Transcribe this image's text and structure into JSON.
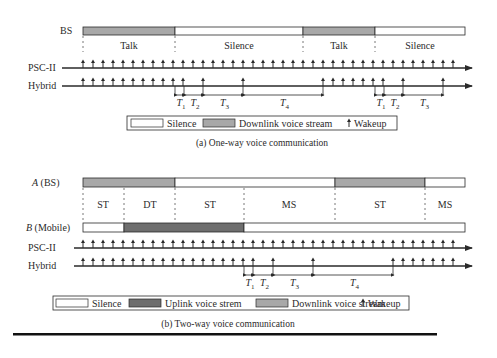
{
  "colors": {
    "downlink": "#a8a8a8",
    "uplink": "#6e6e6e",
    "silence": "#ffffff",
    "line": "#2a2a2a"
  },
  "one_way": {
    "bs_label": "BS",
    "segments": [
      {
        "type": "downlink",
        "x1": 83,
        "x2": 175,
        "label": "Talk"
      },
      {
        "type": "silence",
        "x1": 175,
        "x2": 303,
        "label": "Silence"
      },
      {
        "type": "downlink",
        "x1": 303,
        "x2": 375,
        "label": "Talk"
      },
      {
        "type": "silence",
        "x1": 375,
        "x2": 465,
        "label": "Silence"
      }
    ],
    "psc_label": "PSC-II",
    "hybrid_label": "Hybrid",
    "psc_wakeups": [
      83,
      93,
      103,
      113,
      123,
      133,
      143,
      153,
      163,
      173,
      183,
      193,
      203,
      213,
      223,
      233,
      243,
      253,
      263,
      273,
      283,
      293,
      303,
      313,
      323,
      333,
      343,
      353,
      363,
      373,
      383,
      393,
      403,
      413,
      423,
      433,
      443,
      453
    ],
    "hybrid_wakeups": [
      83,
      93,
      103,
      113,
      123,
      133,
      143,
      153,
      163,
      173,
      183,
      203,
      243,
      323,
      333,
      343,
      353,
      363,
      373,
      383,
      403,
      443
    ],
    "intervals": [
      {
        "label": "T",
        "sub": "1",
        "x1": 175,
        "x2": 184
      },
      {
        "label": "T",
        "sub": "2",
        "x1": 184,
        "x2": 203
      },
      {
        "label": "T",
        "sub": "3",
        "x1": 203,
        "x2": 243
      },
      {
        "label": "T",
        "sub": "4",
        "x1": 243,
        "x2": 323
      },
      {
        "label": "T",
        "sub": "1",
        "x1": 375,
        "x2": 384
      },
      {
        "label": "T",
        "sub": "2",
        "x1": 384,
        "x2": 403
      },
      {
        "label": "T",
        "sub": "3",
        "x1": 403,
        "x2": 443
      }
    ],
    "legend": {
      "silence": "Silence",
      "downlink": "Downlink voice stream",
      "wakeup": "Wakeup"
    },
    "caption": "(a) One-way voice communication"
  },
  "two_way": {
    "a_label_italic": "A",
    "a_label_rest": " (BS)",
    "b_label_italic": "B",
    "b_label_rest": " (Mobile)",
    "a_segments": [
      {
        "type": "downlink",
        "x1": 83,
        "x2": 175
      },
      {
        "type": "silence",
        "x1": 175,
        "x2": 335
      },
      {
        "type": "downlink",
        "x1": 335,
        "x2": 425
      },
      {
        "type": "silence",
        "x1": 425,
        "x2": 465
      }
    ],
    "b_segments": [
      {
        "type": "silence",
        "x1": 83,
        "x2": 124
      },
      {
        "type": "uplink",
        "x1": 124,
        "x2": 244
      },
      {
        "type": "silence",
        "x1": 244,
        "x2": 465
      }
    ],
    "dividers": [
      83,
      124,
      175,
      244,
      335,
      425
    ],
    "states": [
      {
        "label": "ST",
        "x": 103
      },
      {
        "label": "DT",
        "x": 150
      },
      {
        "label": "ST",
        "x": 210
      },
      {
        "label": "MS",
        "x": 289
      },
      {
        "label": "ST",
        "x": 380
      },
      {
        "label": "MS",
        "x": 445
      }
    ],
    "psc_label": "PSC-II",
    "hybrid_label": "Hybrid",
    "psc_wakeups": [
      83,
      93,
      103,
      113,
      123,
      133,
      143,
      153,
      163,
      173,
      183,
      193,
      203,
      213,
      223,
      233,
      243,
      253,
      263,
      273,
      283,
      293,
      303,
      313,
      323,
      333,
      343,
      353,
      363,
      373,
      383,
      393,
      403,
      413,
      423,
      433,
      443,
      453
    ],
    "hybrid_wakeups": [
      83,
      93,
      103,
      113,
      123,
      133,
      143,
      153,
      163,
      173,
      183,
      193,
      203,
      213,
      223,
      233,
      243,
      253,
      273,
      313,
      393,
      403,
      413,
      423,
      433,
      443,
      453
    ],
    "intervals": [
      {
        "label": "T",
        "sub": "1",
        "x1": 244,
        "x2": 253
      },
      {
        "label": "T",
        "sub": "2",
        "x1": 253,
        "x2": 273
      },
      {
        "label": "T",
        "sub": "3",
        "x1": 273,
        "x2": 313
      },
      {
        "label": "T",
        "sub": "4",
        "x1": 313,
        "x2": 393
      }
    ],
    "legend": {
      "silence": "Silence",
      "uplink": "Uplink voice strem",
      "downlink": "Downlink voice stream",
      "wakeup": "Wakeup"
    },
    "caption": "(b) Two-way voice communication"
  }
}
